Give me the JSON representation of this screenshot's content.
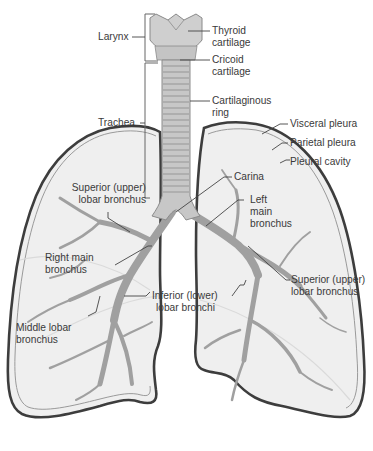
{
  "figure": {
    "colors": {
      "lung_fill": "#eeeeee",
      "lung_outline": "#3d3d3d",
      "pleura_outline": "#8a8a8a",
      "bronchi": "#9b9b9b",
      "trachea": "#bdbdbd",
      "leader_line": "#444444",
      "label_text": "#3a3a3a"
    }
  },
  "labels": {
    "larynx": "Larynx",
    "thyroid_cartilage": [
      "Thyroid",
      "cartilage"
    ],
    "cricoid_cartilage": [
      "Cricoid",
      "cartilage"
    ],
    "cartilaginous_ring": [
      "Cartilaginous",
      "ring"
    ],
    "trachea": "Trachea",
    "visceral_pleura": "Visceral pleura",
    "parietal_pleura": "Parietal pleura",
    "pleural_cavity": "Pleural cavity",
    "carina": "Carina",
    "superior_lobar_bronchus_right": [
      "Superior (upper)",
      "lobar bronchus"
    ],
    "left_main_bronchus": [
      "Left",
      "main",
      "bronchus"
    ],
    "right_main_bronchus": [
      "Right main",
      "bronchus"
    ],
    "superior_lobar_bronchus_left": [
      "Superior (upper)",
      "lobar bronchus"
    ],
    "inferior_lobar_bronchi": [
      "Inferior (lower)",
      "lobar bronchi"
    ],
    "middle_lobar_bronchus": [
      "Middle lobar",
      "bronchus"
    ]
  }
}
